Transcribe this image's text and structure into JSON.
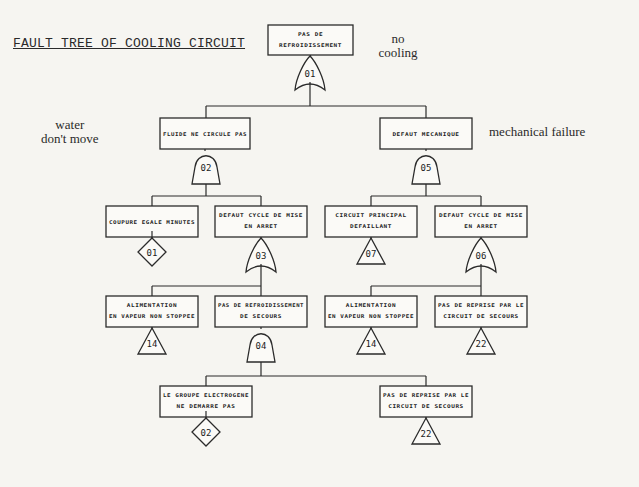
{
  "title": "FAULT TREE OF COOLING CIRCUIT",
  "annotations": [
    {
      "id": "no-cooling",
      "text": "no\ncooling",
      "x": 398,
      "y": 32
    },
    {
      "id": "water-dont-move",
      "text": "water\ndon't move",
      "x": 70,
      "y": 118
    },
    {
      "id": "mechanical-failure",
      "text": "mechanical failure",
      "x": 537,
      "y": 125
    }
  ],
  "events": [
    {
      "id": "top",
      "lines": [
        "PAS DE",
        "REFROIDISSEMENT"
      ],
      "x": 268,
      "y": 25,
      "w": 85,
      "h": 30
    },
    {
      "id": "fluide",
      "lines": [
        "FLUIDE NE CIRCULE PAS"
      ],
      "x": 160,
      "y": 118,
      "w": 90,
      "h": 31
    },
    {
      "id": "defaut-meca",
      "lines": [
        "DEFAUT MECANIQUE"
      ],
      "x": 380,
      "y": 118,
      "w": 92,
      "h": 31
    },
    {
      "id": "coupure",
      "lines": [
        "COUPURE EGALE MINUTES"
      ],
      "x": 106,
      "y": 206,
      "w": 92,
      "h": 31
    },
    {
      "id": "defaut-cycle-1",
      "lines": [
        "DEFAUT CYCLE DE MISE",
        "EN ARRET"
      ],
      "x": 215,
      "y": 206,
      "w": 92,
      "h": 31
    },
    {
      "id": "circuit-principal",
      "lines": [
        "CIRCUIT PRINCIPAL",
        "DEFAILLANT"
      ],
      "x": 325,
      "y": 206,
      "w": 92,
      "h": 31
    },
    {
      "id": "defaut-cycle-2",
      "lines": [
        "DEFAUT CYCLE DE MISE",
        "EN ARRET"
      ],
      "x": 435,
      "y": 206,
      "w": 92,
      "h": 31
    },
    {
      "id": "alim-1",
      "lines": [
        "ALIMENTATION",
        "EN VAPEUR NON STOPPEE"
      ],
      "x": 106,
      "y": 296,
      "w": 92,
      "h": 31
    },
    {
      "id": "pas-refroid-secours",
      "lines": [
        "PAS DE REFROIDISSEMENT",
        "DE SECOURS"
      ],
      "x": 215,
      "y": 296,
      "w": 92,
      "h": 31
    },
    {
      "id": "alim-2",
      "lines": [
        "ALIMENTATION",
        "EN VAPEUR NON STOPPEE"
      ],
      "x": 325,
      "y": 296,
      "w": 92,
      "h": 31
    },
    {
      "id": "reprise-1",
      "lines": [
        "PAS DE REPRISE PAR LE",
        "CIRCUIT DE SECOURS"
      ],
      "x": 435,
      "y": 296,
      "w": 92,
      "h": 31
    },
    {
      "id": "groupe-elec",
      "lines": [
        "LE GROUPE ELECTROGENE",
        "NE DEMARRE PAS"
      ],
      "x": 160,
      "y": 386,
      "w": 92,
      "h": 31
    },
    {
      "id": "reprise-2",
      "lines": [
        "PAS DE REPRISE PAR LE",
        "CIRCUIT DE SECOURS"
      ],
      "x": 380,
      "y": 386,
      "w": 92,
      "h": 31
    }
  ],
  "gates": [
    {
      "id": "g01",
      "type": "or",
      "label": "01",
      "cx": 310,
      "top": 56,
      "w": 28,
      "h": 34
    },
    {
      "id": "g02",
      "type": "and",
      "label": "02",
      "cx": 206,
      "top": 150,
      "w": 28,
      "h": 34
    },
    {
      "id": "g05",
      "type": "and",
      "label": "05",
      "cx": 426,
      "top": 150,
      "w": 28,
      "h": 34
    },
    {
      "id": "g03",
      "type": "or",
      "label": "03",
      "cx": 261,
      "top": 238,
      "w": 28,
      "h": 34
    },
    {
      "id": "g06",
      "type": "or",
      "label": "06",
      "cx": 481,
      "top": 238,
      "w": 28,
      "h": 34
    },
    {
      "id": "g04",
      "type": "and",
      "label": "04",
      "cx": 261,
      "top": 328,
      "w": 28,
      "h": 34
    }
  ],
  "undeveloped": [
    {
      "id": "u01",
      "label": "01",
      "cx": 152,
      "cy": 252
    },
    {
      "id": "u02",
      "label": "02",
      "cx": 206,
      "cy": 432
    }
  ],
  "transfers": [
    {
      "id": "t07",
      "label": "07",
      "cx": 371,
      "top": 238
    },
    {
      "id": "t14a",
      "label": "14",
      "cx": 152,
      "top": 328
    },
    {
      "id": "t14b",
      "label": "14",
      "cx": 371,
      "top": 328
    },
    {
      "id": "t22a",
      "label": "22",
      "cx": 481,
      "top": 328
    },
    {
      "id": "t22b",
      "label": "22",
      "cx": 426,
      "top": 418
    }
  ],
  "connectors": [
    {
      "from_x": 310,
      "from_y": 90,
      "bus_y": 106,
      "children_x": [
        206,
        426
      ]
    },
    {
      "from_x": 206,
      "from_y": 184,
      "bus_y": 196,
      "children_x": [
        152,
        261
      ]
    },
    {
      "from_x": 426,
      "from_y": 184,
      "bus_y": 196,
      "children_x": [
        371,
        481
      ]
    },
    {
      "from_x": 261,
      "from_y": 272,
      "bus_y": 286,
      "children_x": [
        152,
        261
      ]
    },
    {
      "from_x": 481,
      "from_y": 272,
      "bus_y": 286,
      "children_x": [
        371,
        481
      ]
    },
    {
      "from_x": 261,
      "from_y": 362,
      "bus_y": 376,
      "children_x": [
        206,
        426
      ]
    }
  ]
}
